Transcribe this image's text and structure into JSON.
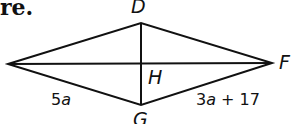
{
  "header_fragment": "re.",
  "figure": {
    "type": "kite",
    "vertices": {
      "left": {
        "label": "",
        "x": 8,
        "y": 64
      },
      "top": {
        "label": "D",
        "x": 141,
        "y": 23
      },
      "right": {
        "label": "F",
        "x": 272,
        "y": 63
      },
      "bottom": {
        "label": "G",
        "x": 141,
        "y": 105
      }
    },
    "intersection_label": "H",
    "side_labels": {
      "left_bottom": "5a",
      "right_bottom_prefix": "3a",
      "right_bottom_suffix": " + 17"
    },
    "stroke_color": "#111111"
  }
}
